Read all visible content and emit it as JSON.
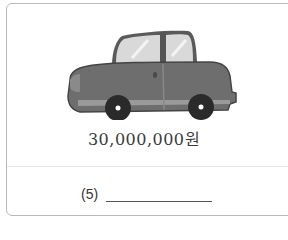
{
  "card": {
    "image": {
      "icon": "car-icon",
      "description": "Gray cartoon sedan car",
      "colors": {
        "body": "#6e6e6e",
        "body_dark": "#4a4a4a",
        "window": "#d9d9d9",
        "wheel": "#2a2a2a",
        "hub": "#ffffff"
      }
    },
    "price": "30,000,000원",
    "question": {
      "label": "(5)",
      "answer": ""
    }
  },
  "colors": {
    "border": "#b8b8b8",
    "divider": "#e6e6e6",
    "text": "#3a3a3a"
  }
}
